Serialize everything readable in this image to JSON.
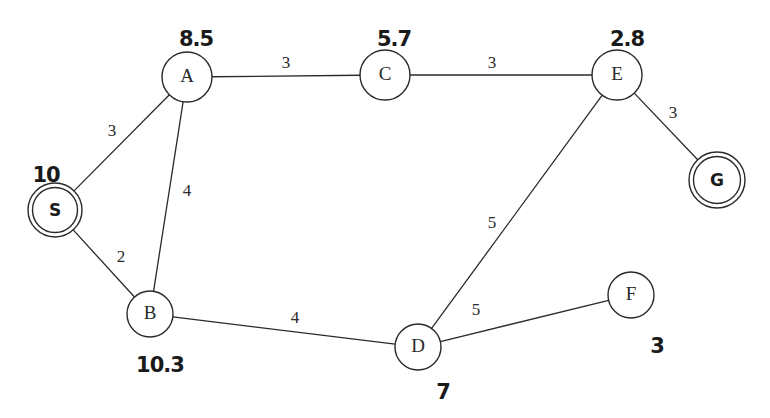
{
  "graph": {
    "nodes": [
      {
        "id": "S",
        "label": "S",
        "x": 55,
        "y": 210,
        "r": 27,
        "double": true,
        "h": "10",
        "hx": 46,
        "hy": 176
      },
      {
        "id": "A",
        "label": "A",
        "x": 187,
        "y": 77,
        "r": 25,
        "double": false,
        "h": "8.5",
        "hx": 196,
        "hy": 40
      },
      {
        "id": "C",
        "label": "C",
        "x": 385,
        "y": 75,
        "r": 25,
        "double": false,
        "h": "5.7",
        "hx": 394,
        "hy": 40
      },
      {
        "id": "E",
        "label": "E",
        "x": 617,
        "y": 75,
        "r": 25,
        "double": false,
        "h": "2.8",
        "hx": 627,
        "hy": 40
      },
      {
        "id": "G",
        "label": "G",
        "x": 717,
        "y": 180,
        "r": 28,
        "double": true,
        "h": "",
        "hx": 0,
        "hy": 0
      },
      {
        "id": "B",
        "label": "B",
        "x": 150,
        "y": 314,
        "r": 23,
        "double": false,
        "h": "10.3",
        "hx": 160,
        "hy": 366
      },
      {
        "id": "D",
        "label": "D",
        "x": 418,
        "y": 347,
        "r": 23,
        "double": false,
        "h": "7",
        "hx": 443,
        "hy": 393
      },
      {
        "id": "F",
        "label": "F",
        "x": 631,
        "y": 295,
        "r": 23,
        "double": false,
        "h": "3",
        "hx": 657,
        "hy": 347
      }
    ],
    "edges": [
      {
        "from": "S",
        "to": "A",
        "weight": "3",
        "lx": 112,
        "ly": 132
      },
      {
        "from": "S",
        "to": "B",
        "weight": "2",
        "lx": 121,
        "ly": 258
      },
      {
        "from": "A",
        "to": "B",
        "weight": "4",
        "lx": 187,
        "ly": 192
      },
      {
        "from": "A",
        "to": "C",
        "weight": "3",
        "lx": 286,
        "ly": 64
      },
      {
        "from": "C",
        "to": "E",
        "weight": "3",
        "lx": 492,
        "ly": 64
      },
      {
        "from": "E",
        "to": "G",
        "weight": "3",
        "lx": 673,
        "ly": 114
      },
      {
        "from": "E",
        "to": "D",
        "weight": "5",
        "lx": 492,
        "ly": 224
      },
      {
        "from": "B",
        "to": "D",
        "weight": "4",
        "lx": 295,
        "ly": 319
      },
      {
        "from": "D",
        "to": "F",
        "weight": "5",
        "lx": 476,
        "ly": 311
      }
    ]
  }
}
